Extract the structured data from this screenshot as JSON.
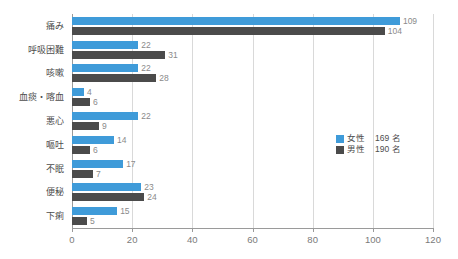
{
  "chart_data": {
    "type": "bar",
    "orientation": "horizontal",
    "title": "",
    "xlabel": "",
    "ylabel": "",
    "xlim": [
      0,
      120
    ],
    "xticks": [
      "0",
      "20",
      "40",
      "60",
      "80",
      "100",
      "120"
    ],
    "grid": true,
    "legend_position": "center-right",
    "categories": [
      "痛み",
      "呼吸困難",
      "咳嗽",
      "血痰・喀血",
      "悪心",
      "嘔吐",
      "不眠",
      "便秘",
      "下痢"
    ],
    "series": [
      {
        "name": "女性",
        "color": "#3f9bd9",
        "total_label": "169 名",
        "values": [
          109,
          22,
          22,
          4,
          22,
          14,
          17,
          23,
          15
        ]
      },
      {
        "name": "男性",
        "color": "#4b4b4b",
        "total_label": "190 名",
        "values": [
          104,
          31,
          28,
          6,
          9,
          6,
          7,
          24,
          5
        ]
      }
    ]
  },
  "legend": {
    "entries": [
      {
        "name": "女性",
        "count": "169 名",
        "swatch": "female-swatch"
      },
      {
        "name": "男性",
        "count": "190 名",
        "swatch": "male-swatch"
      }
    ]
  }
}
